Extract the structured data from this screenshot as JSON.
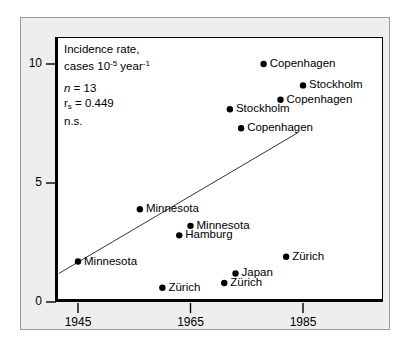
{
  "chart_data": {
    "type": "scatter",
    "title": "",
    "xlabel": "",
    "ylabel": "Incidence rate, cases 10-5 year-1",
    "xlim": [
      1941,
      1990
    ],
    "ylim": [
      0,
      11.1
    ],
    "xticks": [
      1945,
      1965,
      1985
    ],
    "yticks": [
      0,
      5,
      10
    ],
    "grid": false,
    "legend": "none",
    "points": [
      {
        "label": "Copenhagen",
        "x": 1978,
        "y": 10.0
      },
      {
        "label": "Stockholm",
        "x": 1985,
        "y": 9.1
      },
      {
        "label": "Copenhagen",
        "x": 1981,
        "y": 8.5
      },
      {
        "label": "Stockholm",
        "x": 1972,
        "y": 8.1
      },
      {
        "label": "Copenhagen",
        "x": 1974,
        "y": 7.3
      },
      {
        "label": "Minnesota",
        "x": 1956,
        "y": 3.9
      },
      {
        "label": "Minnesota",
        "x": 1965,
        "y": 3.2
      },
      {
        "label": "Hamburg",
        "x": 1963,
        "y": 2.8
      },
      {
        "label": "Zürich",
        "x": 1982,
        "y": 1.9
      },
      {
        "label": "Minnesota",
        "x": 1945,
        "y": 1.7
      },
      {
        "label": "Japan",
        "x": 1973,
        "y": 1.2
      },
      {
        "label": "Zürich",
        "x": 1971,
        "y": 0.8
      },
      {
        "label": "Zürich",
        "x": 1960,
        "y": 0.6
      }
    ],
    "trend_line": {
      "x1": 1941.6,
      "y1": 1.2,
      "x2": 1984.0,
      "y2": 7.1
    },
    "annotations": {
      "axis_caption_line1": "Incidence rate,",
      "axis_caption_line2_prefix": "cases 10",
      "axis_caption_line2_exp1": "-5",
      "axis_caption_line2_mid": " year",
      "axis_caption_line2_exp2": "-1",
      "n_symbol": "n",
      "n_value": "= 13",
      "r_symbol": "r",
      "r_subscript": "s",
      "r_value": "= 0.449",
      "significance": "n.s."
    }
  },
  "colors": {
    "panel_background": "#eeeeee",
    "plot_background": "#ffffff",
    "axis": "#000000",
    "marker": "#000000",
    "trend_line": "#333333",
    "panel_border": "#9a9a9a"
  }
}
